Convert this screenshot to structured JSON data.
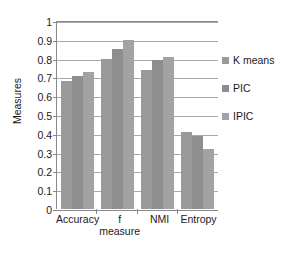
{
  "chart_data": {
    "type": "bar",
    "title": "",
    "xlabel": "",
    "ylabel": "Measures",
    "ylim": [
      0,
      1
    ],
    "ytick_step": 0.1,
    "yticks": [
      "1",
      "0.9",
      "0.8",
      "0.7",
      "0.6",
      "0.5",
      "0.4",
      "0.3",
      "0.2",
      "0.1",
      "0"
    ],
    "grid": true,
    "legend_position": "right",
    "categories": [
      "Accuracy",
      "f measure",
      "NMI",
      "Entropy"
    ],
    "category_lines": [
      [
        "Accuracy",
        ""
      ],
      [
        "f",
        "measure"
      ],
      [
        "NMI",
        ""
      ],
      [
        "Entropy",
        ""
      ]
    ],
    "series": [
      {
        "name": "K means",
        "color": "#9a9a9a",
        "values": [
          0.68,
          0.8,
          0.74,
          0.41
        ]
      },
      {
        "name": "PIC",
        "color": "#8e8e8e",
        "values": [
          0.71,
          0.85,
          0.79,
          0.39
        ]
      },
      {
        "name": "IPIC",
        "color": "#a2a2a2",
        "values": [
          0.73,
          0.9,
          0.81,
          0.32
        ]
      }
    ]
  },
  "colors": {
    "axis": "#8a8a8a",
    "grid": "#a8a8a8",
    "text": "#1a1a1a",
    "background": "#ffffff"
  }
}
